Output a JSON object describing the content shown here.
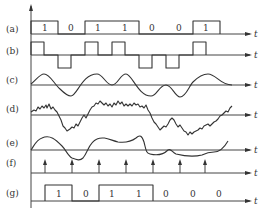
{
  "figure": {
    "axis_label": "t",
    "panels": [
      {
        "id": "a",
        "label": "(a)",
        "bits": [
          "1",
          "0",
          "1",
          "1",
          "0",
          "0",
          "1"
        ]
      },
      {
        "id": "b",
        "label": "(b)"
      },
      {
        "id": "c",
        "label": "(c)"
      },
      {
        "id": "d",
        "label": "(d)"
      },
      {
        "id": "e",
        "label": "(e)"
      },
      {
        "id": "f",
        "label": "(f)"
      },
      {
        "id": "g",
        "label": "(g)",
        "bits": [
          "1",
          "0",
          "1",
          "1",
          "0",
          "0",
          "0"
        ]
      }
    ]
  }
}
